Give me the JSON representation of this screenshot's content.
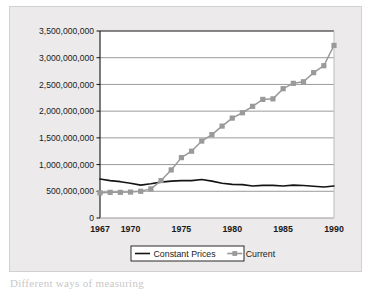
{
  "figure": {
    "background_color": "#eceaea",
    "plot_background_color": "#ffffff",
    "border_color": "#d2d0d0"
  },
  "legend": {
    "position": "bottom-center",
    "items": [
      {
        "label": "Constant Prices",
        "color": "#141414",
        "marker": "none",
        "style": "line"
      },
      {
        "label": "Current",
        "color": "#9a9a9a",
        "marker": "square",
        "style": "line-marker"
      }
    ]
  },
  "axis": {
    "y_ticks": [
      "0",
      "500,000,000",
      "1,000,000,000",
      "1,500,000,000",
      "2,000,000,000",
      "2,500,000,000",
      "3,000,000,000",
      "3,500,000,000"
    ],
    "x_ticks": [
      "1967",
      "1970",
      "1975",
      "1980",
      "1985",
      "1990"
    ]
  },
  "chart_data": {
    "type": "line",
    "title": "",
    "subtitle": "",
    "xlabel": "",
    "ylabel": "",
    "xlim": [
      1967,
      1990
    ],
    "ylim": [
      0,
      3500000000
    ],
    "grid": true,
    "grid_axis": "y",
    "legend_position": "bottom-center",
    "x": [
      1967,
      1968,
      1969,
      1970,
      1971,
      1972,
      1973,
      1974,
      1975,
      1976,
      1977,
      1978,
      1979,
      1980,
      1981,
      1982,
      1983,
      1984,
      1985,
      1986,
      1987,
      1988,
      1989,
      1990
    ],
    "series": [
      {
        "name": "Constant Prices",
        "color": "#141414",
        "marker": "none",
        "values": [
          730000000,
          700000000,
          680000000,
          650000000,
          615000000,
          640000000,
          672000000,
          690000000,
          700000000,
          700000000,
          720000000,
          690000000,
          650000000,
          630000000,
          625000000,
          600000000,
          610000000,
          610000000,
          600000000,
          615000000,
          608000000,
          595000000,
          580000000,
          600000000
        ]
      },
      {
        "name": "Current",
        "color": "#9a9a9a",
        "marker": "square",
        "values": [
          470000000,
          480000000,
          480000000,
          485000000,
          500000000,
          545000000,
          700000000,
          900000000,
          1130000000,
          1250000000,
          1440000000,
          1560000000,
          1720000000,
          1870000000,
          1970000000,
          2090000000,
          2220000000,
          2230000000,
          2420000000,
          2520000000,
          2550000000,
          2720000000,
          2850000000,
          3230000000
        ]
      }
    ]
  },
  "page": {
    "below_text": "Different ways of measuring"
  }
}
